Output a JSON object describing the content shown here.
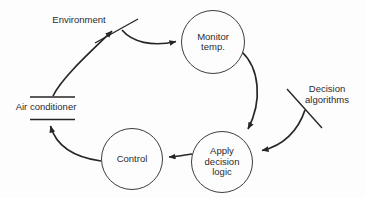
{
  "background": "#fdfdfd",
  "ink": "#262626",
  "nodes": {
    "monitor_temp": {
      "lines": [
        "Monitor",
        "temp."
      ]
    },
    "apply_decision_logic": {
      "lines": [
        "Apply",
        "decision",
        "logic"
      ]
    },
    "control": {
      "label": "Control"
    }
  },
  "externals": {
    "environment": {
      "label": "Environment"
    },
    "decision_algorithms": {
      "lines": [
        "Decision",
        "algorithms"
      ]
    },
    "air_conditioner": {
      "label": "Air conditioner"
    }
  }
}
